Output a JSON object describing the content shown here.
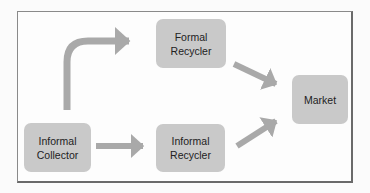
{
  "diagram": {
    "type": "flow",
    "colors": {
      "node_fill": "#c9c9c9",
      "arrow": "#a9a9a9",
      "text": "#222222",
      "frame": "#8a8a8a"
    },
    "nodes": [
      {
        "id": "informal_collector",
        "line1": "Informal",
        "line2": "Collector"
      },
      {
        "id": "formal_recycler",
        "line1": "Formal",
        "line2": "Recycler"
      },
      {
        "id": "informal_recycler",
        "line1": "Informal",
        "line2": "Recycler"
      },
      {
        "id": "market",
        "line1": "Market",
        "line2": ""
      }
    ],
    "edges": [
      {
        "from": "informal_collector",
        "to": "formal_recycler",
        "style": "curved"
      },
      {
        "from": "informal_collector",
        "to": "informal_recycler",
        "style": "straight"
      },
      {
        "from": "formal_recycler",
        "to": "market",
        "style": "straight"
      },
      {
        "from": "informal_recycler",
        "to": "market",
        "style": "straight"
      }
    ]
  }
}
